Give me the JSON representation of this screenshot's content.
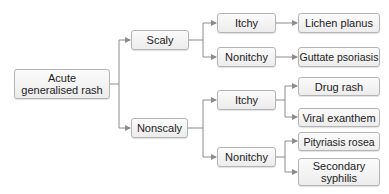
{
  "diagram": {
    "type": "decision-tree",
    "edge_color": "#8c8c8c",
    "nodes": {
      "root": {
        "label": "Acute generalised rash",
        "line1": "Acute",
        "line2": "generalised rash"
      },
      "scaly": {
        "label": "Scaly"
      },
      "nonscaly": {
        "label": "Nonscaly"
      },
      "scaly_itchy": {
        "label": "Itchy"
      },
      "scaly_nonitchy": {
        "label": "Nonitchy"
      },
      "nonscaly_itchy": {
        "label": "Itchy"
      },
      "nonscaly_nonitchy": {
        "label": "Nonitchy"
      },
      "lichen_planus": {
        "label": "Lichen planus"
      },
      "guttate_psoriasis": {
        "label": "Guttate psoriasis"
      },
      "drug_rash": {
        "label": "Drug rash"
      },
      "viral_exanthem": {
        "label": "Viral exanthem"
      },
      "pityriasis_rosea": {
        "label": "Pityriasis rosea"
      },
      "secondary_syphilis": {
        "label": "Secondary syphilis",
        "line1": "Secondary",
        "line2": "syphilis"
      }
    },
    "edges": [
      [
        "root",
        "scaly"
      ],
      [
        "root",
        "nonscaly"
      ],
      [
        "scaly",
        "scaly_itchy"
      ],
      [
        "scaly",
        "scaly_nonitchy"
      ],
      [
        "scaly_itchy",
        "lichen_planus"
      ],
      [
        "scaly_nonitchy",
        "guttate_psoriasis"
      ],
      [
        "nonscaly",
        "nonscaly_itchy"
      ],
      [
        "nonscaly",
        "nonscaly_nonitchy"
      ],
      [
        "nonscaly_itchy",
        "drug_rash"
      ],
      [
        "nonscaly_itchy",
        "viral_exanthem"
      ],
      [
        "nonscaly_nonitchy",
        "pityriasis_rosea"
      ],
      [
        "nonscaly_nonitchy",
        "secondary_syphilis"
      ]
    ]
  }
}
